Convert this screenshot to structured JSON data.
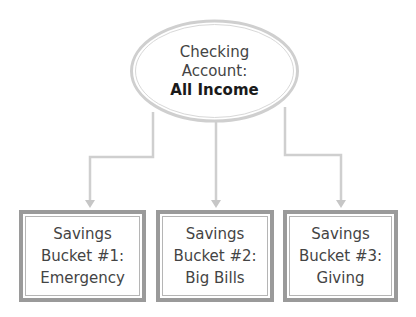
{
  "diagram": {
    "type": "hierarchy",
    "root": {
      "shape": "ellipse",
      "lines": [
        "Checking",
        "Account:",
        "All Income"
      ],
      "bold_line": "All Income"
    },
    "children": [
      {
        "shape": "double-border-box",
        "lines": [
          "Savings",
          "Bucket #1:",
          "Emergency"
        ]
      },
      {
        "shape": "double-border-box",
        "lines": [
          "Savings",
          "Bucket #2:",
          "Big Bills"
        ]
      },
      {
        "shape": "double-border-box",
        "lines": [
          "Savings",
          "Bucket #3:",
          "Giving"
        ]
      }
    ],
    "connectors": [
      {
        "from": "root",
        "to": "children.0",
        "style": "elbow-arrow"
      },
      {
        "from": "root",
        "to": "children.1",
        "style": "straight-arrow"
      },
      {
        "from": "root",
        "to": "children.2",
        "style": "elbow-arrow"
      }
    ],
    "colors": {
      "ellipse_stroke": "#c8c8c8",
      "connector": "#cfcfcf",
      "box_border": "#9a9a9a",
      "box_inner_border": "#b5b5b5",
      "text": "#444444",
      "bold_text": "#1a1a1a"
    }
  }
}
